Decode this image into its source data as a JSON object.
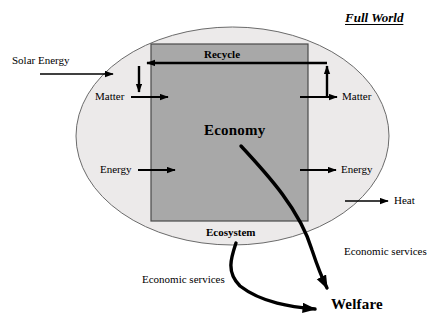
{
  "diagram": {
    "title": "Full World",
    "ellipse_label": "Ecosystem",
    "box_label": "Economy",
    "recycle_label": "Recycle",
    "outcome_label": "Welfare",
    "flows": {
      "solar_energy": "Solar Energy",
      "matter_in": "Matter",
      "matter_out": "Matter",
      "energy_in": "Energy",
      "energy_out": "Energy",
      "heat": "Heat",
      "economic_services_right": "Economic services",
      "economic_services_left": "Economic services"
    },
    "colors": {
      "background": "#ffffff",
      "ellipse_fill": "#eceaea",
      "ellipse_stroke": "#6b6b6b",
      "box_fill": "#a8a8a8",
      "box_stroke": "#4a4a4a",
      "arrow": "#000000",
      "text": "#000000"
    }
  }
}
